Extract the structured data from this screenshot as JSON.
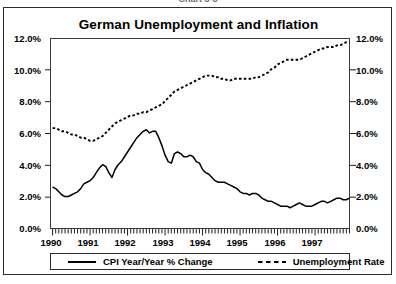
{
  "figure_caption": "Chart 3-3",
  "chart_title": "German Unemployment and Inflation",
  "axes": {
    "y_left_ticks": [
      "0.0%",
      "2.0%",
      "4.0%",
      "6.0%",
      "8.0%",
      "10.0%",
      "12.0%"
    ],
    "y_right_ticks": [
      "0.0%",
      "2.0%",
      "4.0%",
      "6.0%",
      "8.0%",
      "10.0%",
      "12.0%"
    ],
    "x_ticks": [
      "1990",
      "1991",
      "1992",
      "1993",
      "1994",
      "1995",
      "1996",
      "1997"
    ]
  },
  "legend": {
    "entries": [
      {
        "label": "CPI Year/Year % Change",
        "style": "solid",
        "icon": "solid-line-swatch"
      },
      {
        "label": "Unemployment Rate",
        "style": "dashed",
        "icon": "dashed-line-swatch"
      }
    ]
  },
  "colors": {
    "line": "#000000",
    "frame": "#2b2b2b",
    "background": "#ffffff"
  },
  "chart_data": {
    "type": "line",
    "title": "German Unemployment and Inflation",
    "xlabel": "",
    "ylabel": "",
    "ylim": [
      0,
      12
    ],
    "y_tick_step": 2,
    "y_unit": "percent",
    "grid": false,
    "legend_position": "bottom",
    "x_axis_type": "monthly",
    "x_range": [
      "1990-01",
      "1997-12"
    ],
    "x_tick_labels": [
      "1990",
      "1991",
      "1992",
      "1993",
      "1994",
      "1995",
      "1996",
      "1997"
    ],
    "minor_ticks": "monthly",
    "series": [
      {
        "name": "CPI Year/Year % Change",
        "style": "solid",
        "values": [
          2.7,
          2.6,
          2.4,
          2.2,
          2.1,
          2.1,
          2.2,
          2.3,
          2.4,
          2.6,
          2.9,
          3.0,
          3.1,
          3.3,
          3.6,
          3.9,
          4.1,
          4.0,
          3.6,
          3.3,
          3.8,
          4.1,
          4.3,
          4.6,
          4.9,
          5.2,
          5.5,
          5.8,
          6.0,
          6.2,
          6.3,
          6.1,
          6.2,
          6.2,
          5.8,
          5.3,
          4.7,
          4.3,
          4.2,
          4.8,
          4.9,
          4.8,
          4.6,
          4.6,
          4.7,
          4.6,
          4.3,
          4.2,
          3.8,
          3.6,
          3.5,
          3.3,
          3.1,
          3.0,
          3.0,
          3.0,
          2.9,
          2.8,
          2.7,
          2.6,
          2.4,
          2.3,
          2.3,
          2.2,
          2.3,
          2.3,
          2.2,
          2.0,
          1.9,
          1.8,
          1.8,
          1.7,
          1.6,
          1.5,
          1.5,
          1.5,
          1.4,
          1.5,
          1.6,
          1.7,
          1.6,
          1.5,
          1.5,
          1.5,
          1.6,
          1.7,
          1.8,
          1.8,
          1.7,
          1.8,
          1.9,
          2.0,
          2.0,
          1.9,
          1.9,
          2.0
        ]
      },
      {
        "name": "Unemployment Rate",
        "style": "dashed",
        "values": [
          6.4,
          6.4,
          6.3,
          6.2,
          6.2,
          6.1,
          6.0,
          6.0,
          5.9,
          5.8,
          5.8,
          5.7,
          5.6,
          5.6,
          5.7,
          5.8,
          5.9,
          6.1,
          6.3,
          6.5,
          6.7,
          6.8,
          6.9,
          7.0,
          7.1,
          7.2,
          7.2,
          7.3,
          7.3,
          7.4,
          7.4,
          7.5,
          7.6,
          7.7,
          7.8,
          7.9,
          8.1,
          8.3,
          8.5,
          8.7,
          8.8,
          8.9,
          9.0,
          9.1,
          9.2,
          9.3,
          9.4,
          9.5,
          9.6,
          9.7,
          9.7,
          9.7,
          9.6,
          9.6,
          9.5,
          9.5,
          9.4,
          9.4,
          9.5,
          9.5,
          9.5,
          9.5,
          9.5,
          9.5,
          9.5,
          9.6,
          9.6,
          9.7,
          9.8,
          9.9,
          10.1,
          10.2,
          10.4,
          10.5,
          10.6,
          10.7,
          10.7,
          10.7,
          10.7,
          10.7,
          10.8,
          10.9,
          11.0,
          11.1,
          11.2,
          11.3,
          11.4,
          11.4,
          11.5,
          11.5,
          11.5,
          11.6,
          11.6,
          11.7,
          11.8,
          11.8
        ]
      }
    ]
  }
}
